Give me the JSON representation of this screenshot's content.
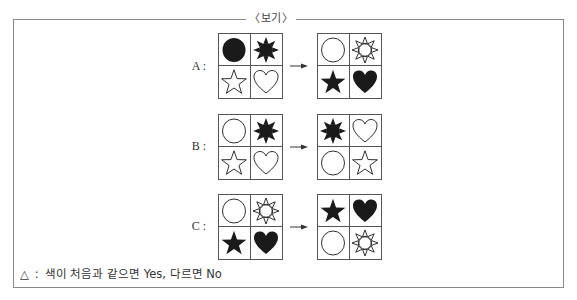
{
  "box": {
    "title": "〈보기〉"
  },
  "rows": [
    {
      "label": "A :",
      "before": [
        "circle-filled",
        "sun-filled",
        "star-outline",
        "heart-outline"
      ],
      "after": [
        "circle-outline",
        "sun-outline",
        "star-filled",
        "heart-filled"
      ]
    },
    {
      "label": "B :",
      "before": [
        "circle-outline",
        "sun-filled",
        "star-outline",
        "heart-outline"
      ],
      "after": [
        "sun-filled",
        "heart-outline",
        "circle-outline",
        "star-outline"
      ]
    },
    {
      "label": "C :",
      "before": [
        "circle-outline",
        "sun-outline",
        "star-filled",
        "heart-filled"
      ],
      "after": [
        "star-filled",
        "heart-filled",
        "circle-outline",
        "sun-outline"
      ]
    }
  ],
  "legend": {
    "symbol": "△",
    "separator": ":",
    "text": "색이 처음과 같으면 Yes, 다르면 No"
  },
  "colors": {
    "ink": "#1a1a1a",
    "border": "#555555",
    "frame": "#8a8a8a"
  }
}
